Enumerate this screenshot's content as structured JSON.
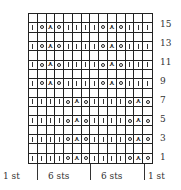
{
  "chart": {
    "columns": 14,
    "rows_total": 16,
    "symbols": {
      "K": {
        "name": "knit",
        "glyph": "|"
      },
      "O": {
        "name": "yarn-over",
        "glyph": "○"
      },
      "A": {
        "name": "double-decrease",
        "glyph": "⋏"
      }
    },
    "pattern_rows": [
      {
        "row": 15,
        "cells": [
          "K",
          "O",
          "A",
          "O",
          "K",
          "K",
          "K",
          "K",
          "O",
          "A",
          "O",
          "K",
          "K",
          "K"
        ]
      },
      {
        "row": 13,
        "cells": [
          "K",
          "O",
          "A",
          "O",
          "K",
          "K",
          "K",
          "K",
          "O",
          "A",
          "O",
          "K",
          "K",
          "K"
        ]
      },
      {
        "row": 11,
        "cells": [
          "K",
          "O",
          "A",
          "O",
          "K",
          "K",
          "K",
          "K",
          "O",
          "A",
          "O",
          "K",
          "K",
          "K"
        ]
      },
      {
        "row": 9,
        "cells": [
          "K",
          "O",
          "A",
          "O",
          "K",
          "K",
          "K",
          "K",
          "O",
          "A",
          "O",
          "K",
          "K",
          "K"
        ]
      },
      {
        "row": 7,
        "cells": [
          "K",
          "K",
          "K",
          "K",
          "O",
          "A",
          "O",
          "K",
          "K",
          "K",
          "K",
          "O",
          "A",
          "O"
        ]
      },
      {
        "row": 5,
        "cells": [
          "K",
          "K",
          "K",
          "K",
          "O",
          "A",
          "O",
          "K",
          "K",
          "K",
          "K",
          "O",
          "A",
          "O"
        ]
      },
      {
        "row": 3,
        "cells": [
          "K",
          "K",
          "K",
          "K",
          "O",
          "A",
          "O",
          "K",
          "K",
          "K",
          "K",
          "O",
          "A",
          "O"
        ]
      },
      {
        "row": 1,
        "cells": [
          "K",
          "K",
          "K",
          "K",
          "O",
          "A",
          "O",
          "K",
          "K",
          "K",
          "K",
          "O",
          "A",
          "O"
        ]
      }
    ]
  },
  "row_labels": [
    "15",
    "13",
    "11",
    "9",
    "7",
    "5",
    "3",
    "1"
  ],
  "footer": {
    "labels": [
      "1 st",
      "6 sts",
      "6 sts",
      "1 st"
    ]
  }
}
